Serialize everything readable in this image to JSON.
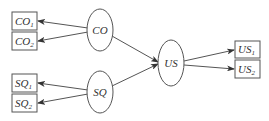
{
  "diagram": {
    "colors": {
      "stroke": "#555555",
      "text": "#333333",
      "background": "#ffffff"
    },
    "nodes": {
      "co": {
        "label": "CO",
        "shape": "ellipse"
      },
      "sq": {
        "label": "SQ",
        "shape": "ellipse"
      },
      "us": {
        "label": "US",
        "shape": "ellipse"
      },
      "co1": {
        "base": "CO",
        "sub": "1",
        "shape": "box"
      },
      "co2": {
        "base": "CO",
        "sub": "2",
        "shape": "box"
      },
      "sq1": {
        "base": "SQ",
        "sub": "1",
        "shape": "box"
      },
      "sq2": {
        "base": "SQ",
        "sub": "2",
        "shape": "box"
      },
      "us1": {
        "base": "US",
        "sub": "1",
        "shape": "box"
      },
      "us2": {
        "base": "US",
        "sub": "2",
        "shape": "box"
      }
    },
    "edges": [
      {
        "from": "CO",
        "to": "CO1"
      },
      {
        "from": "CO",
        "to": "CO2"
      },
      {
        "from": "SQ",
        "to": "SQ1"
      },
      {
        "from": "SQ",
        "to": "SQ2"
      },
      {
        "from": "CO",
        "to": "US"
      },
      {
        "from": "SQ",
        "to": "US"
      },
      {
        "from": "US",
        "to": "US1"
      },
      {
        "from": "US",
        "to": "US2"
      }
    ]
  }
}
